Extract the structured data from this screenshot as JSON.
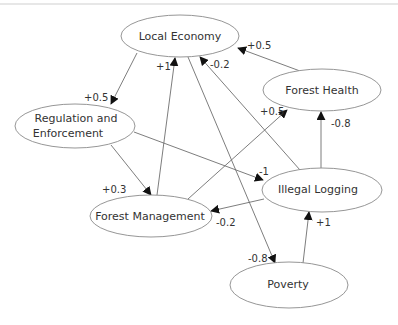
{
  "diagram": {
    "type": "causal-loop",
    "nodes": [
      {
        "id": "local_economy",
        "label": "Local Economy",
        "cx": 180,
        "cy": 36,
        "rx": 59,
        "ry": 21
      },
      {
        "id": "regulation",
        "label_line1": "Regulation and",
        "label_line2": "Enforcement",
        "cx": 75,
        "cy": 126,
        "rx": 60,
        "ry": 22
      },
      {
        "id": "forest_health",
        "label": "Forest Health",
        "cx": 322,
        "cy": 90,
        "rx": 59,
        "ry": 21
      },
      {
        "id": "forest_management",
        "label": "Forest Management",
        "cx": 151,
        "cy": 216,
        "rx": 61,
        "ry": 21
      },
      {
        "id": "illegal_logging",
        "label": "Illegal Logging",
        "cx": 322,
        "cy": 190,
        "rx": 60,
        "ry": 22
      },
      {
        "id": "poverty",
        "label": "Poverty",
        "cx": 289,
        "cy": 285,
        "rx": 59,
        "ry": 23
      }
    ],
    "edges": [
      {
        "from": "Local Economy",
        "to": "Regulation and Enforcement",
        "weight": "+0.5"
      },
      {
        "from": "Regulation and Enforcement",
        "to": "Forest Management",
        "weight": "+0.3"
      },
      {
        "from": "Regulation and Enforcement",
        "to": "Illegal Logging",
        "weight": "-1"
      },
      {
        "from": "Forest Management",
        "to": "Local Economy",
        "weight": "+1"
      },
      {
        "from": "Illegal Logging",
        "to": "Local Economy",
        "weight": "-0.2"
      },
      {
        "from": "Forest Health",
        "to": "Local Economy",
        "weight": "+0.5"
      },
      {
        "from": "Forest Management",
        "to": "Forest Health",
        "weight": "+0.5"
      },
      {
        "from": "Illegal Logging",
        "to": "Forest Health",
        "weight": "-0.8"
      },
      {
        "from": "Illegal Logging",
        "to": "Forest Management",
        "weight": "-0.2"
      },
      {
        "from": "Local Economy",
        "to": "Poverty",
        "weight": "-0.8"
      },
      {
        "from": "Poverty",
        "to": "Illegal Logging",
        "weight": "+1"
      }
    ]
  },
  "labels": {
    "local_economy": "Local Economy",
    "regulation_1": "Regulation and",
    "regulation_2": "Enforcement",
    "forest_health": "Forest Health",
    "forest_management": "Forest Management",
    "illegal_logging": "Illegal Logging",
    "poverty": "Poverty",
    "w_le_reg": "+0.5",
    "w_reg_fm": "+0.3",
    "w_reg_il": "-1",
    "w_fm_le": "+1",
    "w_il_le": "-0.2",
    "w_fh_le": "+0.5",
    "w_fm_fh": "+0.5",
    "w_il_fh": "-0.8",
    "w_il_fm": "-0.2",
    "w_le_pov": "-0.8",
    "w_pov_il": "+1"
  }
}
